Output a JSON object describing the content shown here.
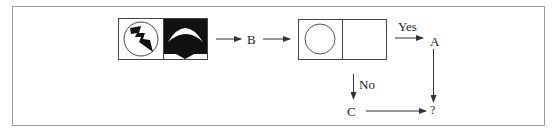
{
  "diagram": {
    "type": "visual-analogy-flow",
    "panel1": {
      "left_cell": {
        "icon": "lightning-bolt-in-circle-icon",
        "background": "#ffffff"
      },
      "right_cell": {
        "icon": "crescent-over-dome-icon",
        "background": "#111111"
      }
    },
    "arrow_label_1": "B",
    "panel2": {
      "left_cell": {
        "icon": "empty-circle-icon",
        "background": "#ffffff"
      },
      "right_cell": {
        "icon": "",
        "background": "#ffffff"
      }
    },
    "yes_label": "Yes",
    "no_label": "No",
    "node_a": "A",
    "node_c": "C",
    "result": "?",
    "colors": {
      "line": "#333333",
      "frame": "#9a9a9a",
      "fill_dark": "#111111"
    }
  }
}
